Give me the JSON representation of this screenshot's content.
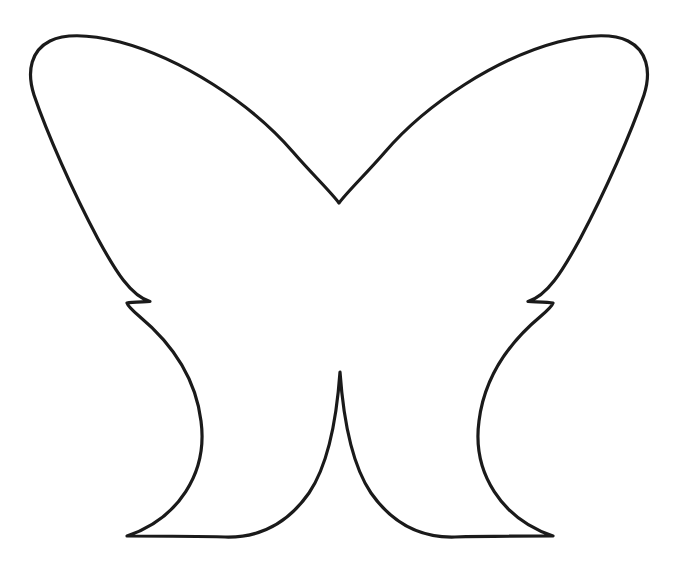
{
  "canvas": {
    "width": 673,
    "height": 571,
    "background_color": "#ffffff"
  },
  "artwork": {
    "title": "Butterfly Outline",
    "subject": "butterfly",
    "style": "line-art-coloring-template",
    "fill_color": "#ffffff",
    "stroke_color": "#1a1a1a",
    "stroke_width_px": 3.2,
    "symmetry": "bilateral-vertical",
    "axis_of_symmetry_x": 338,
    "parts": [
      {
        "name": "upper-left-wing",
        "label": "Upper Left Wing",
        "outer_top_corner": [
          38,
          38
        ],
        "leftmost_point": [
          30,
          74
        ],
        "inner_notch_point": [
          150,
          300
        ],
        "apex_point": [
          339,
          203
        ]
      },
      {
        "name": "upper-right-wing",
        "label": "Upper Right Wing",
        "outer_top_corner": [
          638,
          38
        ],
        "rightmost_point": [
          646,
          74
        ],
        "inner_notch_point": [
          527,
          300
        ],
        "apex_point": [
          339,
          203
        ]
      },
      {
        "name": "lower-left-wing",
        "label": "Lower Left Wing",
        "leftmost_point": [
          88,
          445
        ],
        "bottom_point": [
          220,
          538
        ],
        "inner_notch_point": [
          150,
          300
        ],
        "center_join_point": [
          338,
          370
        ]
      },
      {
        "name": "lower-right-wing",
        "label": "Lower Right Wing",
        "rightmost_point": [
          588,
          445
        ],
        "bottom_point": [
          455,
          538
        ],
        "inner_notch_point": [
          527,
          300
        ],
        "center_join_point": [
          338,
          370
        ]
      }
    ],
    "key_vertices": {
      "top_v_notch": [
        339,
        203
      ],
      "bottom_v_notch": [
        338,
        370
      ],
      "left_side_notch": [
        150,
        300
      ],
      "right_side_notch": [
        527,
        300
      ]
    },
    "bounding_box": {
      "left": 30,
      "top": 36,
      "right": 646,
      "bottom": 540
    },
    "path_d": "M 150.0 301.5 C 131 296 116 272 98 239 C 72 190 47 133 34 95 C 26 70 32 50 50 41 C 66 33 92 35 120 42 C 180 58 250 102 293 152 C 313 175 330 191 339 203 C 348 191 365 175 385 152 C 428 102 498 58 558 42 C 586 35 612 33 628 41 C 646 50 652 70 644 95 C 631 133 606 190 580 239 C 562 272 547 296 528 301.5 C 541 302 549 302 553 303 C 552 306 548 310 541 316 C 505 346 484 381 479 421 C 472 473 502 519 553 536 C 519 536 486 536 455 537 C 420 538 392 523 371 493 C 354 468 344 428 340 372 C 336 428 326 468 309 493 C 288 523 260 538 225 537 C 194 536 161 536 127 536 C 178 519 208 473 201 421 C 196 381 175 346 139 316 C 132 310 128 306 127 303 C 131 302 139 302 150 301.5 Z"
  }
}
